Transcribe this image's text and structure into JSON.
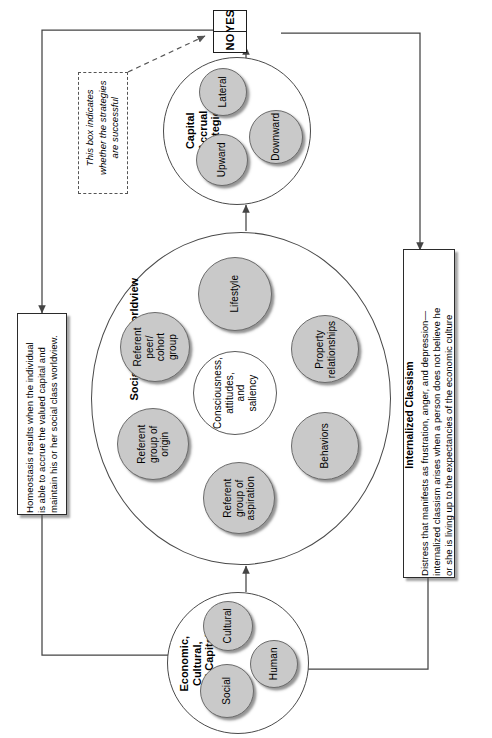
{
  "diagram": {
    "decision": {
      "yes_label": "YES",
      "no_label": "NO"
    },
    "annotation": {
      "text": "This box indicates\nwhether the strategies\nare successful"
    },
    "capital_accrual": {
      "group_label": "Capital\nAccrual\nStrategies",
      "nodes": [
        {
          "label": "Lateral"
        },
        {
          "label": "Downward"
        },
        {
          "label": "Upward"
        }
      ]
    },
    "social_class_worldview": {
      "group_label": "Social Class Worldview",
      "center": {
        "label": "Consciousness,\nattitudes,\nand\nsaliency"
      },
      "nodes": [
        {
          "label": "Lifestyle"
        },
        {
          "label": "Property\nrelationships"
        },
        {
          "label": "Behaviors"
        },
        {
          "label": "Referent\ngroup of\naspiration"
        },
        {
          "label": "Referent\ngroup of\norigin"
        },
        {
          "label": "Referent\npeer/\ncohort\ngroup"
        }
      ]
    },
    "capital_forms": {
      "group_label": "Economic,\nCultural,\nand Capital",
      "nodes": [
        {
          "label": "Cultural"
        },
        {
          "label": "Human"
        },
        {
          "label": "Social"
        }
      ]
    },
    "homeostasis_box": {
      "text": "Homeostasis results when the individual\nis able to accrue the valued capital and\nmaintain his or her social class worldview."
    },
    "internalized_classism_box": {
      "title": "Internalized Classism",
      "text": "Distress that manifests as frustration, anger, and depression—\ninternalized classism arises when a person does not believe he\nor she is living up to the expectancies of the economic culture"
    },
    "colors": {
      "node_fill": "#c9c9c9",
      "node_stroke": "#6b6b6b",
      "circle_stroke": "#4a4a4a",
      "box_stroke": "#2b2b2b",
      "line": "#444444"
    }
  }
}
